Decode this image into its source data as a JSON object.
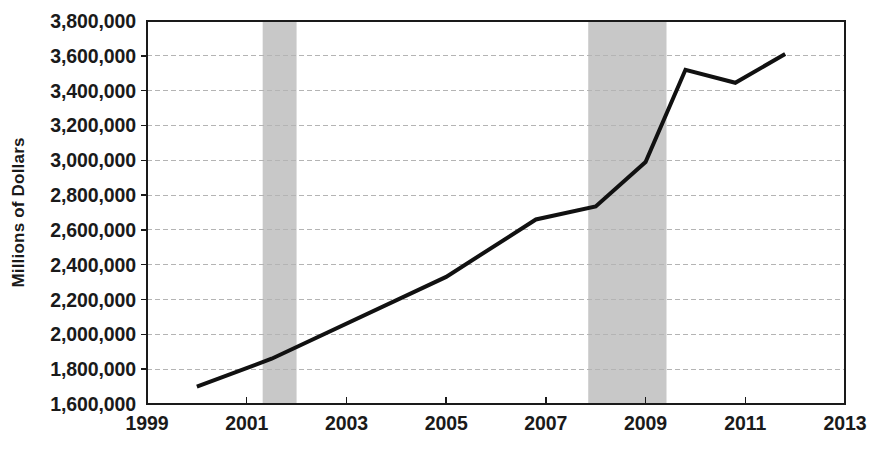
{
  "chart_data": {
    "type": "line",
    "title": "",
    "subtitle": "",
    "xlabel": "",
    "ylabel": "Millions of Dollars",
    "xlim": [
      1999,
      2013
    ],
    "ylim": [
      1600000,
      3800000
    ],
    "grid": true,
    "grid_axis": "y",
    "legend": "none",
    "y_ticks": [
      "1,600,000",
      "1,800,000",
      "2,000,000",
      "2,200,000",
      "2,400,000",
      "2,600,000",
      "2,800,000",
      "3,000,000",
      "3,200,000",
      "3,400,000",
      "3,600,000",
      "3,800,000"
    ],
    "y_tick_values": [
      1600000,
      1800000,
      2000000,
      2200000,
      2400000,
      2600000,
      2800000,
      3000000,
      3200000,
      3400000,
      3600000,
      3800000
    ],
    "x_ticks": [
      "1999",
      "2001",
      "2003",
      "2005",
      "2007",
      "2009",
      "2011",
      "2013"
    ],
    "x_tick_values": [
      1999,
      2001,
      2003,
      2005,
      2007,
      2009,
      2011,
      2013
    ],
    "series": [
      {
        "name": "Millions of Dollars",
        "color": "#111111",
        "line_width": 4,
        "x": [
          2000.0,
          2001.5,
          2005.0,
          2006.8,
          2008.0,
          2009.0,
          2009.8,
          2010.8,
          2011.8
        ],
        "values": [
          1700000,
          1860000,
          2330000,
          2660000,
          2735000,
          2990000,
          3520000,
          3445000,
          3610000
        ]
      }
    ],
    "shaded_regions": [
      {
        "label": "recession-band-2001",
        "x_start": 2001.32,
        "x_end": 2002.0,
        "color": "#c8c8c8"
      },
      {
        "label": "recession-band-2008",
        "x_start": 2007.85,
        "x_end": 2009.42,
        "color": "#c8c8c8"
      }
    ],
    "colors": {
      "line": "#111111",
      "shading": "#c8c8c8",
      "grid": "#b4b4b4",
      "frame": "#1a1a1a",
      "background": "#ffffff",
      "text": "#1a1a1a"
    }
  },
  "caption": {
    "text": ""
  }
}
